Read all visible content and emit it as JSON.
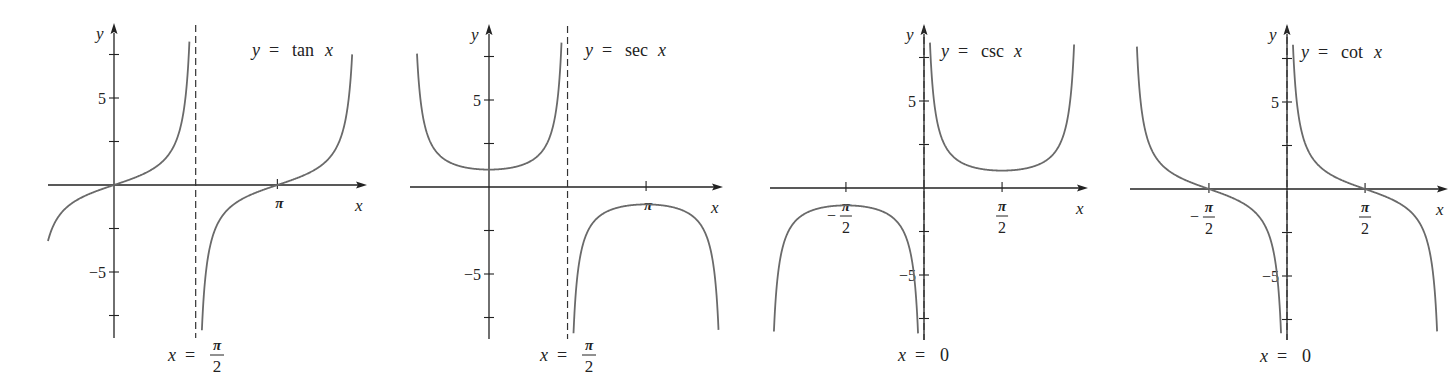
{
  "chart_data": [
    {
      "type": "line",
      "title": "y = tan x",
      "function": "tan",
      "xlabel": "x",
      "ylabel": "y",
      "label_parts": {
        "lhs": "y",
        "eq": "=",
        "fn": "tan",
        "arg": "x"
      },
      "xlim": [
        -1.3,
        4.5
      ],
      "ylim": [
        -8.8,
        9.0
      ],
      "x_ticks": [
        {
          "value": 3.14159,
          "label": "π",
          "num": "π",
          "den": ""
        }
      ],
      "y_ticks": [
        -7.5,
        -5,
        -2.5,
        2.5,
        5,
        7.5
      ],
      "y_tick_labels": [
        {
          "value": 5,
          "label": "5"
        },
        {
          "value": -5,
          "label": "−5"
        }
      ],
      "asymptotes": [
        {
          "x": 1.5708,
          "label": "x = π/2",
          "lhs": "x",
          "eq": "=",
          "num": "π",
          "den": "2"
        }
      ],
      "series": [
        {
          "name": "tan x branch 1",
          "x_range": [
            -1.27,
            1.45
          ]
        },
        {
          "name": "tan x branch 2",
          "x_range": [
            1.69,
            4.58
          ]
        }
      ],
      "sample_points": [
        {
          "x": -1.0,
          "y": -1.557
        },
        {
          "x": 0,
          "y": 0
        },
        {
          "x": 1.0,
          "y": 1.557
        },
        {
          "x": 3.14159,
          "y": 0
        },
        {
          "x": 4.0,
          "y": 1.158
        }
      ],
      "grid": false,
      "legend": "none"
    },
    {
      "type": "line",
      "title": "y = sec x",
      "function": "sec",
      "xlabel": "x",
      "ylabel": "y",
      "label_parts": {
        "lhs": "y",
        "eq": "=",
        "fn": "sec",
        "arg": "x"
      },
      "xlim": [
        -1.5,
        4.6
      ],
      "ylim": [
        -8.8,
        9.0
      ],
      "x_ticks": [
        {
          "value": 3.14159,
          "label": "π",
          "num": "π",
          "den": ""
        }
      ],
      "y_ticks": [
        -7.5,
        -5,
        -2.5,
        2.5,
        5,
        7.5
      ],
      "y_tick_labels": [
        {
          "value": 5,
          "label": "5"
        },
        {
          "value": -5,
          "label": "−5"
        }
      ],
      "asymptotes": [
        {
          "x": 1.5708,
          "label": "x = π/2",
          "lhs": "x",
          "eq": "=",
          "num": "π",
          "den": "2"
        }
      ],
      "series": [
        {
          "name": "sec x branch 1",
          "x_range": [
            -1.44,
            1.45
          ]
        },
        {
          "name": "sec x branch 2",
          "x_range": [
            1.69,
            4.6
          ]
        }
      ],
      "sample_points": [
        {
          "x": 0,
          "y": 1
        },
        {
          "x": 1.0,
          "y": 1.851
        },
        {
          "x": 3.14159,
          "y": -1
        },
        {
          "x": 2.5,
          "y": -1.248
        }
      ],
      "grid": false,
      "legend": "none"
    },
    {
      "type": "line",
      "title": "y = csc x",
      "function": "csc",
      "xlabel": "x",
      "ylabel": "y",
      "label_parts": {
        "lhs": "y",
        "eq": "=",
        "fn": "csc",
        "arg": "x"
      },
      "xlim": [
        -3.1,
        3.3
      ],
      "ylim": [
        -8.8,
        9.0
      ],
      "x_ticks": [
        {
          "value": -1.5708,
          "label": "−π/2",
          "neg": true,
          "num": "π",
          "den": "2"
        },
        {
          "value": 1.5708,
          "label": "π/2",
          "neg": false,
          "num": "π",
          "den": "2"
        }
      ],
      "y_ticks": [
        -7.5,
        -5,
        -2.5,
        2.5,
        5,
        7.5
      ],
      "y_tick_labels": [
        {
          "value": 5,
          "label": "5"
        },
        {
          "value": -5,
          "label": "−5"
        }
      ],
      "asymptotes": [
        {
          "x": 0,
          "label": "x = 0",
          "lhs": "x",
          "eq": "=",
          "num": "0",
          "den": ""
        }
      ],
      "series": [
        {
          "name": "csc x branch 1",
          "x_range": [
            -3.02,
            -0.12
          ]
        },
        {
          "name": "csc x branch 2",
          "x_range": [
            0.12,
            3.02
          ]
        }
      ],
      "sample_points": [
        {
          "x": -1.5708,
          "y": -1
        },
        {
          "x": 1.5708,
          "y": 1
        },
        {
          "x": 0.5,
          "y": 2.086
        }
      ],
      "grid": false,
      "legend": "none"
    },
    {
      "type": "line",
      "title": "y = cot x",
      "function": "cot",
      "xlabel": "x",
      "ylabel": "y",
      "label_parts": {
        "lhs": "y",
        "eq": "=",
        "fn": "cot",
        "arg": "x"
      },
      "xlim": [
        -3.1,
        3.3
      ],
      "ylim": [
        -8.8,
        9.0
      ],
      "x_ticks": [
        {
          "value": -1.5708,
          "label": "−π/2",
          "neg": true,
          "num": "π",
          "den": "2"
        },
        {
          "value": 1.5708,
          "label": "π/2",
          "neg": false,
          "num": "π",
          "den": "2"
        }
      ],
      "y_ticks": [
        -7.5,
        -5,
        -2.5,
        2.5,
        5,
        7.5
      ],
      "y_tick_labels": [
        {
          "value": 5,
          "label": "5"
        },
        {
          "value": -5,
          "label": "−5"
        }
      ],
      "asymptotes": [
        {
          "x": 0,
          "label": "x = 0",
          "lhs": "x",
          "eq": "=",
          "num": "0",
          "den": ""
        }
      ],
      "series": [
        {
          "name": "cot x branch 1",
          "x_range": [
            -3.02,
            -0.12
          ]
        },
        {
          "name": "cot x branch 2",
          "x_range": [
            0.12,
            3.02
          ]
        }
      ],
      "sample_points": [
        {
          "x": -1.5708,
          "y": 0
        },
        {
          "x": 1.5708,
          "y": 0
        },
        {
          "x": 0.7854,
          "y": 1
        }
      ],
      "grid": false,
      "legend": "none"
    }
  ],
  "layout": {
    "panels": [
      {
        "ox": 114,
        "oy": 185,
        "px_per_rad": 52.0,
        "px_per_unit": 17.4,
        "axis_left": 48,
        "axis_right": 367,
        "axis_top": 27,
        "axis_bottom": 338,
        "title_x": 252,
        "title_y": 56,
        "asym_label_x": 168,
        "asym_label_y": 361
      },
      {
        "ox": 489,
        "oy": 187,
        "px_per_rad": 50.0,
        "px_per_unit": 17.4,
        "axis_left": 410,
        "axis_right": 723,
        "axis_top": 28,
        "axis_bottom": 339,
        "title_x": 585,
        "title_y": 56,
        "asym_label_x": 540,
        "asym_label_y": 361
      },
      {
        "ox": 924,
        "oy": 188,
        "px_per_rad": 49.7,
        "px_per_unit": 17.4,
        "axis_left": 770,
        "axis_right": 1088,
        "axis_top": 28,
        "axis_bottom": 340,
        "title_x": 941,
        "title_y": 57,
        "asym_label_x": 898,
        "asym_label_y": 361
      },
      {
        "ox": 1287,
        "oy": 189,
        "px_per_rad": 49.7,
        "px_per_unit": 17.4,
        "axis_left": 1130,
        "axis_right": 1448,
        "axis_top": 28,
        "axis_bottom": 340,
        "title_x": 1301,
        "title_y": 58,
        "asym_label_x": 1260,
        "asym_label_y": 362
      }
    ]
  },
  "colors": {
    "axis": "#222222",
    "curve": "#6a6a6a",
    "asymptote": "#333333",
    "background": "#ffffff"
  }
}
